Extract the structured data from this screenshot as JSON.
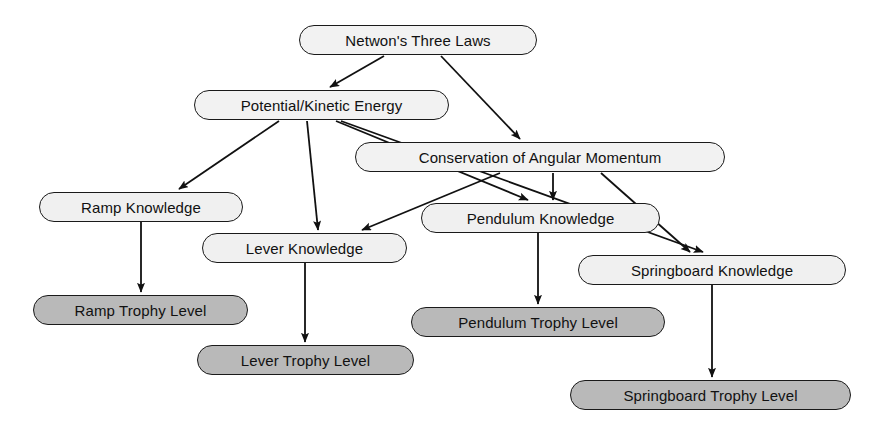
{
  "diagram": {
    "type": "directed-graph",
    "background": "#ffffff",
    "edge_color": "#111111",
    "node_border_color": "#1a1a1a",
    "concept_fill": "#f2f2f2",
    "knowledge_fill": "#f0f0f0",
    "trophy_fill": "#b9b9b9"
  },
  "nodes": [
    {
      "id": "newtons_laws",
      "label": "Netwon's Three Laws",
      "category": "concept",
      "x": 299,
      "y": 25,
      "w": 238,
      "h": 30
    },
    {
      "id": "potential_kinetic",
      "label": "Potential/Kinetic Energy",
      "category": "concept",
      "x": 194,
      "y": 90,
      "w": 255,
      "h": 30
    },
    {
      "id": "conservation",
      "label": "Conservation of Angular Momentum",
      "category": "concept",
      "x": 355,
      "y": 142,
      "w": 370,
      "h": 30
    },
    {
      "id": "ramp_knowledge",
      "label": "Ramp Knowledge",
      "category": "knowledge",
      "x": 39,
      "y": 192,
      "w": 204,
      "h": 30
    },
    {
      "id": "pendulum_knowledge",
      "label": "Pendulum Knowledge",
      "category": "knowledge",
      "x": 421,
      "y": 203,
      "w": 239,
      "h": 30
    },
    {
      "id": "lever_knowledge",
      "label": "Lever Knowledge",
      "category": "knowledge",
      "x": 202,
      "y": 233,
      "w": 205,
      "h": 30
    },
    {
      "id": "springboard_knowledge",
      "label": "Springboard Knowledge",
      "category": "knowledge",
      "x": 578,
      "y": 255,
      "w": 268,
      "h": 30
    },
    {
      "id": "ramp_trophy",
      "label": "Ramp Trophy Level",
      "category": "trophy",
      "x": 33,
      "y": 295,
      "w": 215,
      "h": 30
    },
    {
      "id": "pendulum_trophy",
      "label": "Pendulum Trophy Level",
      "category": "trophy",
      "x": 411,
      "y": 307,
      "w": 254,
      "h": 30
    },
    {
      "id": "lever_trophy",
      "label": "Lever Trophy Level",
      "category": "trophy",
      "x": 197,
      "y": 345,
      "w": 217,
      "h": 30
    },
    {
      "id": "springboard_trophy",
      "label": "Springboard Trophy Level",
      "category": "trophy",
      "x": 570,
      "y": 380,
      "w": 281,
      "h": 30
    }
  ],
  "edges": [
    {
      "from": "newtons_laws",
      "to": "potential_kinetic",
      "path": "M 384 56 L 330 87"
    },
    {
      "from": "newtons_laws",
      "to": "conservation",
      "path": "M 441 56 L 520 139"
    },
    {
      "from": "potential_kinetic",
      "to": "ramp_knowledge",
      "path": "M 279 121 L 179 189"
    },
    {
      "from": "potential_kinetic",
      "to": "lever_knowledge",
      "path": "M 307 121 L 318 230"
    },
    {
      "from": "potential_kinetic",
      "to": "pendulum_knowledge",
      "path": "M 336 121 L 528 200"
    },
    {
      "from": "potential_kinetic",
      "to": "springboard_knowledge",
      "path": "M 341 121 L 703 252"
    },
    {
      "from": "conservation",
      "to": "lever_knowledge",
      "path": "M 500 173 L 362 230"
    },
    {
      "from": "conservation",
      "to": "pendulum_knowledge",
      "path": "M 553 173 L 553 200"
    },
    {
      "from": "conservation",
      "to": "springboard_knowledge",
      "path": "M 601 173 L 690 252"
    },
    {
      "from": "ramp_knowledge",
      "to": "ramp_trophy",
      "path": "M 141 222 L 141 292"
    },
    {
      "from": "lever_knowledge",
      "to": "lever_trophy",
      "path": "M 305 263 L 305 342"
    },
    {
      "from": "pendulum_knowledge",
      "to": "pendulum_trophy",
      "path": "M 538 233 L 538 304"
    },
    {
      "from": "springboard_knowledge",
      "to": "springboard_trophy",
      "path": "M 712 285 L 712 377"
    }
  ]
}
